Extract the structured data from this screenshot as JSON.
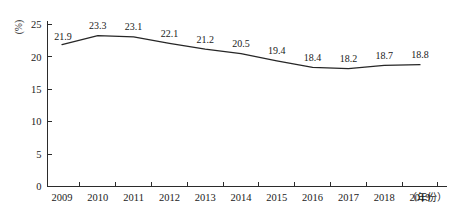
{
  "chart_data": {
    "type": "line",
    "title": "",
    "xlabel": "（年份）",
    "ylabel": "(%)",
    "categories": [
      "2009",
      "2010",
      "2011",
      "2012",
      "2013",
      "2014",
      "2015",
      "2016",
      "2017",
      "2018",
      "2019"
    ],
    "values": [
      21.9,
      23.3,
      23.1,
      22.1,
      21.2,
      20.5,
      19.4,
      18.4,
      18.2,
      18.7,
      18.8
    ],
    "value_labels": [
      "21.9",
      "23.3",
      "23.1",
      "22.1",
      "21.2",
      "20.5",
      "19.4",
      "18.4",
      "18.2",
      "18.7",
      "18.8"
    ],
    "ylim": [
      0,
      25
    ],
    "yticks": [
      0,
      5,
      10,
      15,
      20,
      25
    ],
    "ytick_labels": [
      "0",
      "5",
      "10",
      "15",
      "20",
      "25"
    ],
    "grid": false,
    "legend": null,
    "series_color": "#262626",
    "axis_color": "#2b2b2b",
    "show_markers": false,
    "data_labels_shown": true
  },
  "axes": {
    "y_unit_label": "(%)",
    "x_name_label": "（年份）"
  }
}
